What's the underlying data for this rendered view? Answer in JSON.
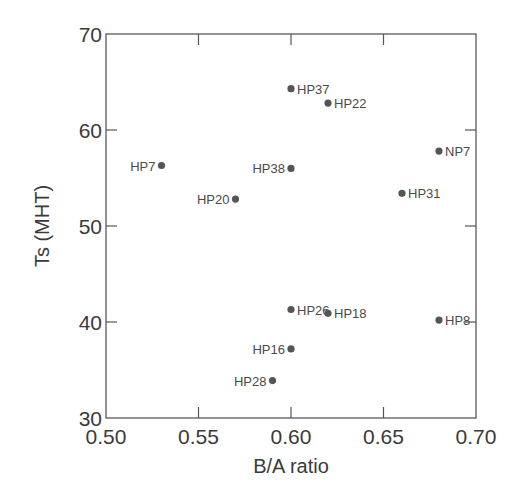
{
  "chart_data": {
    "type": "scatter",
    "title": "",
    "xlabel": "B/A ratio",
    "ylabel": "Ts (MHT)",
    "xlim": [
      0.5,
      0.7
    ],
    "ylim": [
      30,
      70
    ],
    "xticks": [
      "0.50",
      "0.55",
      "0.60",
      "0.65",
      "0.70"
    ],
    "yticks": [
      "30",
      "40",
      "50",
      "60",
      "70"
    ],
    "grid": false,
    "legend": null,
    "points": [
      {
        "label": "HP37",
        "x": 0.6,
        "y": 64.3,
        "label_side": "right"
      },
      {
        "label": "HP22",
        "x": 0.62,
        "y": 62.8,
        "label_side": "right"
      },
      {
        "label": "NP7",
        "x": 0.68,
        "y": 57.8,
        "label_side": "right"
      },
      {
        "label": "HP7",
        "x": 0.53,
        "y": 56.3,
        "label_side": "left"
      },
      {
        "label": "HP38",
        "x": 0.6,
        "y": 56.0,
        "label_side": "left"
      },
      {
        "label": "HP31",
        "x": 0.66,
        "y": 53.4,
        "label_side": "right"
      },
      {
        "label": "HP20",
        "x": 0.57,
        "y": 52.8,
        "label_side": "left"
      },
      {
        "label": "HP26",
        "x": 0.6,
        "y": 41.3,
        "label_side": "right"
      },
      {
        "label": "HP18",
        "x": 0.62,
        "y": 40.9,
        "label_side": "right"
      },
      {
        "label": "HP8",
        "x": 0.68,
        "y": 40.2,
        "label_side": "right"
      },
      {
        "label": "HP16",
        "x": 0.6,
        "y": 37.2,
        "label_side": "left"
      },
      {
        "label": "HP28",
        "x": 0.59,
        "y": 33.9,
        "label_side": "left"
      }
    ],
    "colors": {
      "marker": "#555555",
      "axis": "#555555",
      "text": "#3a3a3a"
    }
  }
}
